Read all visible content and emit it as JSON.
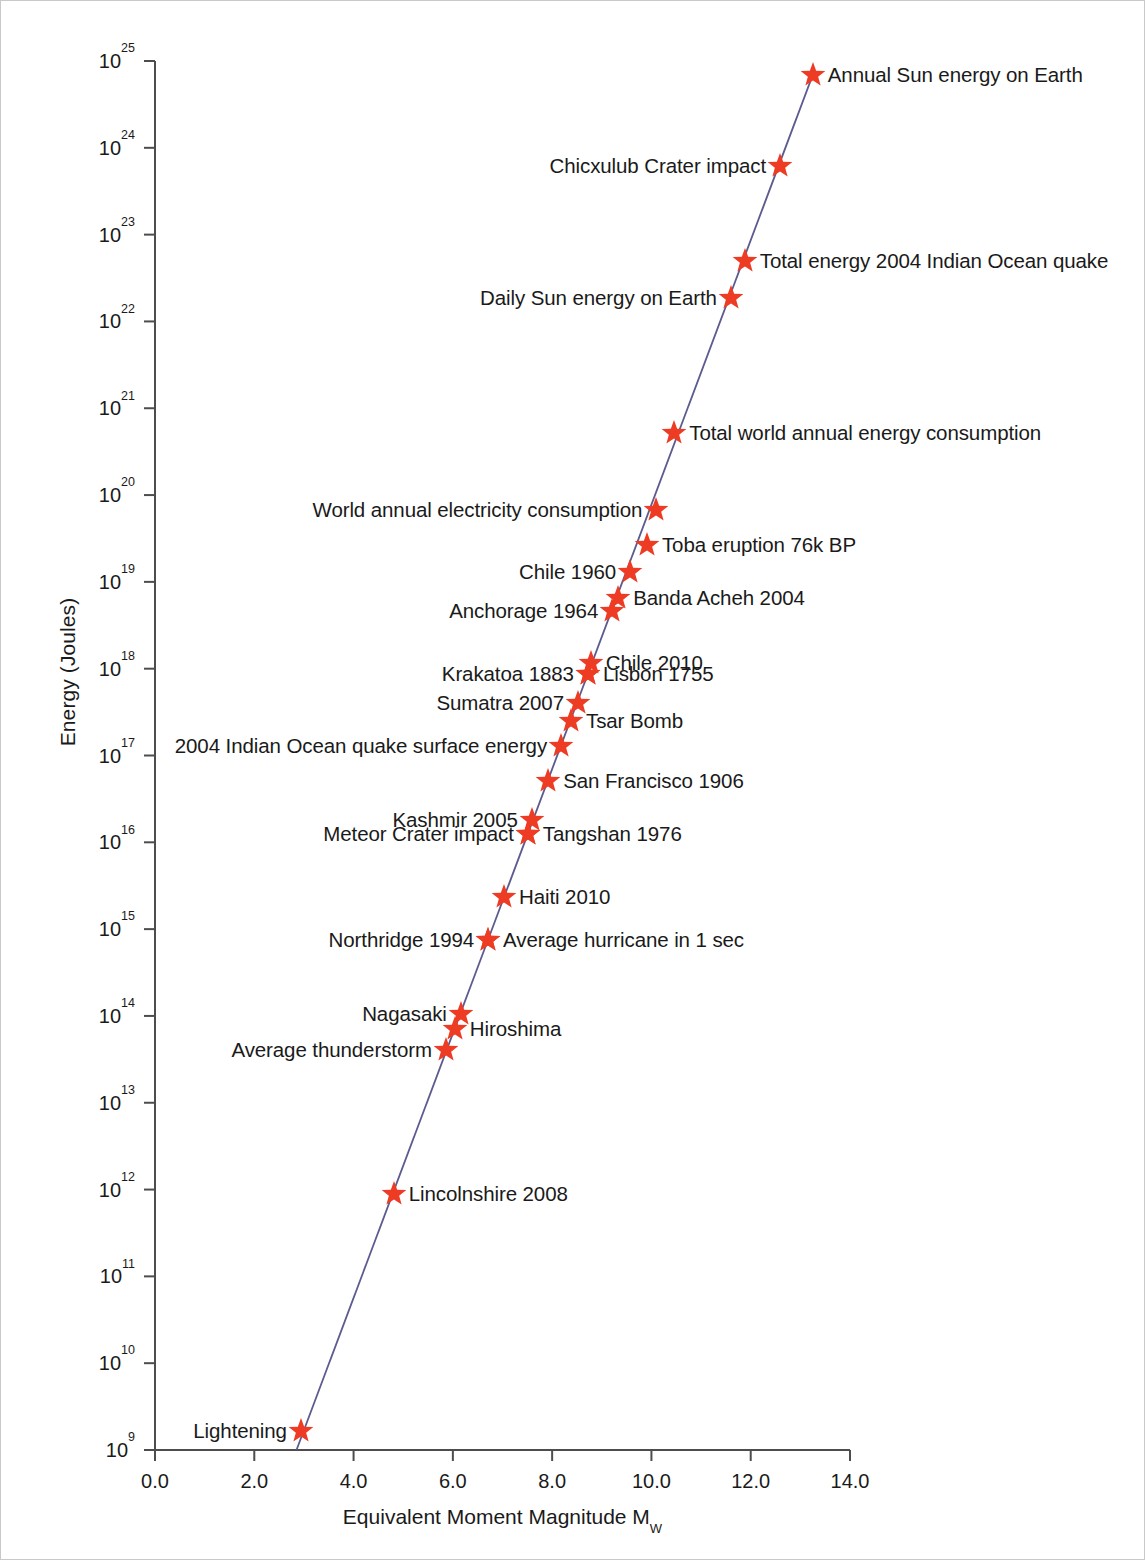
{
  "figure": {
    "background": "#ffffff",
    "border_color": "#c9c9c9",
    "marker_color": "#ee3b24",
    "line_color": "#5b5b8e",
    "axis_color": "#4d4d4d"
  },
  "axes": {
    "ylabel": "Energy (Joules)",
    "xlabel_pre": "Equivalent Moment Magnitude M",
    "xlabel_sub": "W",
    "ylabel_full": "Energy (Joules)",
    "xlabel_full": "Equivalent Moment Magnitude MW",
    "ytick_base": "10",
    "ytick_exponents": [
      "9",
      "10",
      "11",
      "12",
      "13",
      "14",
      "15",
      "16",
      "17",
      "18",
      "19",
      "20",
      "21",
      "22",
      "23",
      "24",
      "25"
    ],
    "xtick_labels": [
      "0.0",
      "2.0",
      "4.0",
      "6.0",
      "8.0",
      "10.0",
      "12.0",
      "14.0"
    ],
    "xtick_values": [
      0,
      2,
      4,
      6,
      8,
      10,
      12,
      14
    ],
    "xlim": [
      0,
      14
    ],
    "ylim_exp": [
      9,
      25
    ],
    "grid": "off",
    "legend": "none"
  },
  "chart_data": {
    "type": "scatter",
    "title": "",
    "xlabel": "Equivalent Moment Magnitude Mw",
    "ylabel": "Energy (Joules)",
    "xlim": [
      0,
      14
    ],
    "ylim": [
      1000000000.0,
      1e+25
    ],
    "yscale": "log",
    "grid": false,
    "legend_position": "none",
    "series_name": "Energy vs equivalent moment magnitude",
    "trendline": {
      "description": "straight line on log-energy vs magnitude axes",
      "x_start": 2.85,
      "y_start_exp": 9.0,
      "x_end": 13.25,
      "y_end_exp": 24.84
    },
    "points": [
      {
        "label": "Annual Sun energy on Earth",
        "magnitude": 13.25,
        "energy_exp": 24.84,
        "energy": 7e+24,
        "label_side": "right"
      },
      {
        "label": "Chicxulub Crater impact",
        "magnitude": 12.59,
        "energy_exp": 23.79,
        "energy": 6.2e+23,
        "label_side": "left"
      },
      {
        "label": "Total energy 2004 Indian Ocean quake",
        "magnitude": 11.88,
        "energy_exp": 22.7,
        "energy": 5e+22,
        "label_side": "right"
      },
      {
        "label": "Daily Sun energy on Earth",
        "magnitude": 11.6,
        "energy_exp": 22.27,
        "energy": 1.9e+22,
        "label_side": "left"
      },
      {
        "label": "Total world annual energy consumption",
        "magnitude": 10.46,
        "energy_exp": 20.72,
        "energy": 5.2e+20,
        "label_side": "right"
      },
      {
        "label": "World annual electricity consumption",
        "magnitude": 10.1,
        "energy_exp": 19.83,
        "energy": 6.7e+19,
        "label_side": "left"
      },
      {
        "label": "Toba eruption 76k BP",
        "magnitude": 9.91,
        "energy_exp": 19.43,
        "energy": 2.7e+19,
        "label_side": "right"
      },
      {
        "label": "Chile 1960",
        "magnitude": 9.57,
        "energy_exp": 19.11,
        "energy": 1.3e+19,
        "label_side": "left"
      },
      {
        "label": "Banda Acheh 2004",
        "magnitude": 9.33,
        "energy_exp": 18.82,
        "energy": 6.6e+18,
        "label_side": "right"
      },
      {
        "label": "Anchorage 1964",
        "magnitude": 9.21,
        "energy_exp": 18.66,
        "energy": 4.6e+18,
        "label_side": "left"
      },
      {
        "label": "Chile 2010",
        "magnitude": 8.78,
        "energy_exp": 18.06,
        "energy": 1.1e+18,
        "label_side": "right"
      },
      {
        "label": "Lisbon 1755",
        "magnitude": 8.72,
        "energy_exp": 17.94,
        "energy": 8.8e+17,
        "label_side": "right"
      },
      {
        "label": "Krakatoa 1883",
        "magnitude": 8.72,
        "energy_exp": 17.94,
        "energy": 8.8e+17,
        "label_side": "left"
      },
      {
        "label": "Sumatra 2007",
        "magnitude": 8.52,
        "energy_exp": 17.61,
        "energy": 4.1e+17,
        "label_side": "left"
      },
      {
        "label": "Tsar Bomb",
        "magnitude": 8.38,
        "energy_exp": 17.4,
        "energy": 2.5e+17,
        "label_side": "right"
      },
      {
        "label": "2004 Indian Ocean quake surface energy",
        "magnitude": 8.18,
        "energy_exp": 17.11,
        "energy": 1.3e+17,
        "label_side": "left"
      },
      {
        "label": "San Francisco 1906",
        "magnitude": 7.92,
        "energy_exp": 16.71,
        "energy": 5.1e+16,
        "label_side": "right"
      },
      {
        "label": "Kashmir 2005",
        "magnitude": 7.59,
        "energy_exp": 16.26,
        "energy": 1.8e+16,
        "label_side": "left"
      },
      {
        "label": "Tangshan 1976",
        "magnitude": 7.51,
        "energy_exp": 16.1,
        "energy": 1.3e+16,
        "label_side": "right"
      },
      {
        "label": "Meteor Crater impact",
        "magnitude": 7.51,
        "energy_exp": 16.1,
        "energy": 1.3e+16,
        "label_side": "left"
      },
      {
        "label": "Haiti 2010",
        "magnitude": 7.03,
        "energy_exp": 15.37,
        "energy": 2300000000000000.0,
        "label_side": "right"
      },
      {
        "label": "Average hurricane in 1 sec",
        "magnitude": 6.71,
        "energy_exp": 14.87,
        "energy": 740000000000000.0,
        "label_side": "right"
      },
      {
        "label": "Northridge 1994",
        "magnitude": 6.71,
        "energy_exp": 14.87,
        "energy": 740000000000000.0,
        "label_side": "left"
      },
      {
        "label": "Nagasaki",
        "magnitude": 6.16,
        "energy_exp": 14.02,
        "energy": 100000000000000.0,
        "label_side": "left"
      },
      {
        "label": "Hiroshima",
        "magnitude": 6.04,
        "energy_exp": 13.85,
        "energy": 71000000000000.0,
        "label_side": "right"
      },
      {
        "label": "Average thunderstorm",
        "magnitude": 5.86,
        "energy_exp": 13.61,
        "energy": 41000000000000.0,
        "label_side": "left"
      },
      {
        "label": "Lincolnshire 2008",
        "magnitude": 4.81,
        "energy_exp": 11.95,
        "energy": 900000000000.0,
        "label_side": "right"
      },
      {
        "label": "Lightening",
        "magnitude": 2.94,
        "energy_exp": 9.22,
        "energy": 1700000000.0,
        "label_side": "left"
      }
    ]
  }
}
